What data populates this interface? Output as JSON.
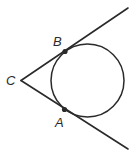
{
  "diagram": {
    "type": "geometry",
    "colors": {
      "stroke": "#2a2a2a",
      "background": "#ffffff"
    },
    "circle": {
      "cx": 87.5,
      "cy": 80.5,
      "r": 36.5
    },
    "vertex": {
      "label": "C",
      "x": 21,
      "y": 80.5
    },
    "tangent_points": [
      {
        "label": "B",
        "x": 65,
        "y": 51.5
      },
      {
        "label": "A",
        "x": 64.5,
        "y": 109.5
      }
    ],
    "rays": [
      {
        "name": "ray-CB",
        "x1": 21,
        "y1": 80.5,
        "x2": 128,
        "y2": 8
      },
      {
        "name": "ray-CA",
        "x1": 21,
        "y1": 80.5,
        "x2": 128,
        "y2": 149
      }
    ],
    "labels": {
      "C": "C",
      "B": "B",
      "A": "A"
    }
  }
}
